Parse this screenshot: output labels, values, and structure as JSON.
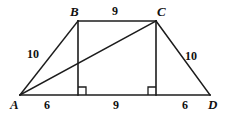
{
  "figure": {
    "kind": "geometry-diagram",
    "shape": "trapezoid-with-diagonal",
    "stroke_color": "#1c1c1c",
    "background_color": "#ffffff",
    "vertices": [
      {
        "name": "A",
        "label": "A",
        "x": 20,
        "y": 95,
        "label_x": 10,
        "label_y": 98
      },
      {
        "name": "B",
        "label": "B",
        "x": 78,
        "y": 21,
        "label_x": 70,
        "label_y": 5
      },
      {
        "name": "C",
        "label": "C",
        "x": 156,
        "y": 21,
        "label_x": 157,
        "label_y": 5
      },
      {
        "name": "D",
        "label": "D",
        "x": 210,
        "y": 95,
        "label_x": 208,
        "label_y": 98
      }
    ],
    "edges": [
      {
        "name": "AB",
        "from": "A",
        "to": "B"
      },
      {
        "name": "BC",
        "from": "B",
        "to": "C"
      },
      {
        "name": "CD",
        "from": "C",
        "to": "D"
      },
      {
        "name": "AD",
        "from": "A",
        "to": "D"
      },
      {
        "name": "AC-diagonal",
        "from": "A",
        "to": "C"
      },
      {
        "name": "B-altitude",
        "from": "B",
        "to": "foot-of-B"
      },
      {
        "name": "C-altitude",
        "from": "C",
        "to": "foot-of-C"
      }
    ],
    "feet": [
      {
        "name": "foot-of-B",
        "x": 78,
        "y": 95
      },
      {
        "name": "foot-of-C",
        "x": 156,
        "y": 95
      }
    ],
    "right_angles": [
      {
        "name": "right-angle-at-foot-of-B",
        "x": 78,
        "y": 95,
        "size": 8,
        "dir_x": 1
      },
      {
        "name": "right-angle-at-foot-of-C",
        "x": 156,
        "y": 95,
        "size": 8,
        "dir_x": -1
      }
    ],
    "measure_labels": [
      {
        "name": "length-ab",
        "value": "10",
        "x": 27,
        "y": 48
      },
      {
        "name": "length-bc",
        "value": "9",
        "x": 112,
        "y": 5
      },
      {
        "name": "length-cd",
        "value": "10",
        "x": 185,
        "y": 50
      },
      {
        "name": "length-a-to-footb",
        "value": "6",
        "x": 44,
        "y": 99
      },
      {
        "name": "length-footb-to-footc",
        "value": "9",
        "x": 113,
        "y": 99
      },
      {
        "name": "length-footc-to-d",
        "value": "6",
        "x": 182,
        "y": 99
      }
    ]
  }
}
